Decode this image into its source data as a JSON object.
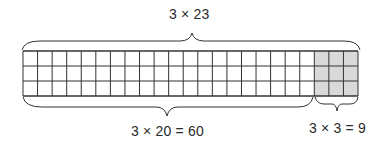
{
  "diagram": {
    "top_label": "3 × 23",
    "bottom_left_label": "3 × 20 = 60",
    "bottom_right_label": "3 × 3 = 9",
    "grid": {
      "rows": 3,
      "columns": 23,
      "shaded_columns_start": 20,
      "shaded_columns_count": 3,
      "shaded_color": "#d9d9d9",
      "line_color": "#333333"
    }
  }
}
